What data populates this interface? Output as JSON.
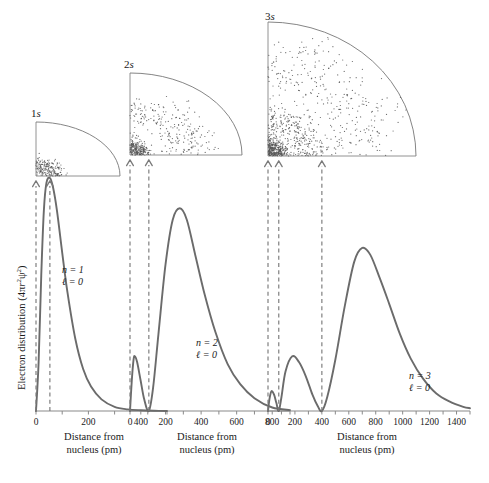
{
  "figure": {
    "y_axis_label": "Electron distribution (4πr²ψ²)",
    "x_axis_title_line1": "Distance from",
    "x_axis_title_line2": "nucleus (pm)",
    "curve_color": "#6b6b6b",
    "axis_color": "#8a8a8a",
    "dot_color": "#555555",
    "arrow_color": "#7a7a7a"
  },
  "chart_data": [
    {
      "type": "line",
      "title": "1s",
      "orbital_label": "1s",
      "annotation_n": "n = 1",
      "annotation_l": "ℓ = 0",
      "xlabel": "Distance from nucleus (pm)",
      "ylabel": "Electron distribution (4πr²ψ²)",
      "xlim": [
        0,
        500
      ],
      "xticks": [
        0,
        100,
        200,
        300,
        400,
        500
      ],
      "xticklabels": [
        "0",
        "",
        "200",
        "",
        "400",
        ""
      ],
      "grid": false,
      "peak_positions_pm": [
        53
      ],
      "node_positions_pm": [],
      "x": [
        0,
        10,
        20,
        30,
        40,
        53,
        65,
        80,
        100,
        120,
        150,
        180,
        210,
        250,
        300,
        350,
        400,
        450,
        500
      ],
      "y": [
        0.0,
        0.21,
        0.58,
        0.86,
        0.98,
        1.0,
        0.96,
        0.86,
        0.68,
        0.51,
        0.31,
        0.18,
        0.105,
        0.05,
        0.018,
        0.007,
        0.003,
        0.001,
        0.0
      ]
    },
    {
      "type": "line",
      "title": "2s",
      "orbital_label": "2s",
      "annotation_n": "n = 2",
      "annotation_l": "ℓ = 0",
      "xlabel": "Distance from nucleus (pm)",
      "ylabel": "Electron distribution (4πr²ψ²)",
      "xlim": [
        0,
        900
      ],
      "xticks": [
        0,
        100,
        200,
        300,
        400,
        500,
        600,
        700,
        800,
        900
      ],
      "xticklabels": [
        "0",
        "",
        "200",
        "",
        "400",
        "",
        "600",
        "",
        "800",
        ""
      ],
      "grid": false,
      "peak_positions_pm": [
        27,
        280
      ],
      "node_positions_pm": [
        106
      ],
      "x": [
        0,
        10,
        20,
        27,
        40,
        60,
        80,
        106,
        130,
        160,
        200,
        240,
        280,
        320,
        370,
        420,
        480,
        550,
        620,
        700,
        800,
        900
      ],
      "y": [
        0.0,
        0.13,
        0.22,
        0.235,
        0.21,
        0.13,
        0.05,
        0.0,
        0.1,
        0.33,
        0.63,
        0.82,
        0.87,
        0.82,
        0.66,
        0.5,
        0.34,
        0.2,
        0.115,
        0.055,
        0.015,
        0.004
      ]
    },
    {
      "type": "line",
      "title": "3s",
      "orbital_label": "3s",
      "annotation_n": "n = 3",
      "annotation_l": "ℓ = 0",
      "xlabel": "Distance from nucleus (pm)",
      "ylabel": "Electron distribution (4πr²ψ²)",
      "xlim": [
        0,
        1500
      ],
      "xticks": [
        0,
        100,
        200,
        300,
        400,
        500,
        600,
        700,
        800,
        900,
        1000,
        1100,
        1200,
        1300,
        1400,
        1500
      ],
      "xticklabels": [
        "0",
        "",
        "200",
        "",
        "400",
        "",
        "600",
        "",
        "800",
        "",
        "1000",
        "",
        "1200",
        "",
        "1400",
        ""
      ],
      "grid": false,
      "peak_positions_pm": [
        26,
        180,
        700
      ],
      "node_positions_pm": [
        80,
        400
      ],
      "x": [
        0,
        12,
        26,
        45,
        62,
        80,
        100,
        130,
        180,
        230,
        280,
        330,
        370,
        400,
        440,
        500,
        570,
        640,
        700,
        760,
        830,
        900,
        980,
        1060,
        1150,
        1250,
        1350,
        1450,
        1500
      ],
      "y": [
        0.0,
        0.055,
        0.085,
        0.07,
        0.035,
        0.0,
        0.06,
        0.17,
        0.235,
        0.21,
        0.15,
        0.07,
        0.02,
        0.0,
        0.06,
        0.22,
        0.45,
        0.64,
        0.7,
        0.67,
        0.57,
        0.46,
        0.33,
        0.225,
        0.14,
        0.075,
        0.04,
        0.018,
        0.012
      ]
    }
  ],
  "orbital_diagrams": [
    {
      "label": "1s",
      "shell_count": 1,
      "arrow_values_pm": [
        0,
        53
      ]
    },
    {
      "label": "2s",
      "shell_count": 2,
      "arrow_values_pm": [
        0,
        106
      ]
    },
    {
      "label": "3s",
      "shell_count": 3,
      "arrow_values_pm": [
        0,
        80,
        400
      ]
    }
  ]
}
